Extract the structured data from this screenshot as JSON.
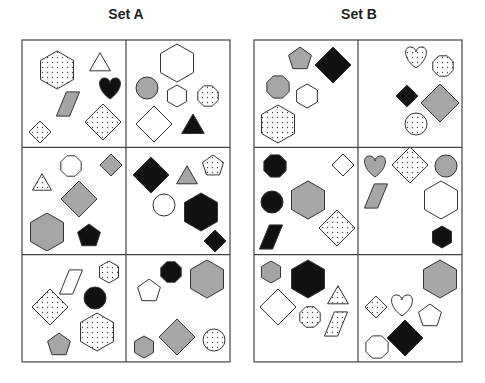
{
  "sets": [
    {
      "title": "Set A",
      "grid": {
        "x": 22,
        "y": 40,
        "col_w": 104,
        "row_h": 107.3
      },
      "panels": [
        {
          "row": 0,
          "col": 0,
          "shapes": [
            {
              "type": "hexagon",
              "fill": "dots",
              "cx": 57,
              "cy": 70,
              "r": 19
            },
            {
              "type": "triangle",
              "fill": "white",
              "cx": 100,
              "cy": 63,
              "r": 12
            },
            {
              "type": "heart",
              "fill": "black",
              "cx": 110,
              "cy": 88,
              "r": 11
            },
            {
              "type": "parallelogram",
              "fill": "gray",
              "cx": 68,
              "cy": 104,
              "r": 11
            },
            {
              "type": "diamond",
              "fill": "dots",
              "cx": 103,
              "cy": 122,
              "r": 18
            },
            {
              "type": "diamond",
              "fill": "dots",
              "cx": 40,
              "cy": 132,
              "r": 11
            }
          ]
        },
        {
          "row": 0,
          "col": 1,
          "shapes": [
            {
              "type": "hexagon",
              "fill": "white",
              "cx": 177,
              "cy": 63,
              "r": 19
            },
            {
              "type": "circle",
              "fill": "gray",
              "cx": 147,
              "cy": 88,
              "r": 11
            },
            {
              "type": "hexagon",
              "fill": "white",
              "cx": 177,
              "cy": 96,
              "r": 11
            },
            {
              "type": "octagon",
              "fill": "dots",
              "cx": 208,
              "cy": 96,
              "r": 11
            },
            {
              "type": "diamond",
              "fill": "white",
              "cx": 154,
              "cy": 124,
              "r": 18
            },
            {
              "type": "triangle",
              "fill": "black",
              "cx": 193,
              "cy": 125,
              "r": 13
            }
          ]
        },
        {
          "row": 1,
          "col": 0,
          "shapes": [
            {
              "type": "octagon",
              "fill": "white",
              "cx": 71,
              "cy": 166,
              "r": 11
            },
            {
              "type": "diamond",
              "fill": "gray",
              "cx": 111,
              "cy": 165,
              "r": 11
            },
            {
              "type": "triangle",
              "fill": "dots",
              "cx": 42,
              "cy": 183,
              "r": 11
            },
            {
              "type": "diamond",
              "fill": "gray",
              "cx": 79,
              "cy": 199,
              "r": 18
            },
            {
              "type": "hexagon",
              "fill": "gray",
              "cx": 47,
              "cy": 232,
              "r": 19
            },
            {
              "type": "pentagon",
              "fill": "black",
              "cx": 89,
              "cy": 236,
              "r": 12
            }
          ]
        },
        {
          "row": 1,
          "col": 1,
          "shapes": [
            {
              "type": "diamond",
              "fill": "black",
              "cx": 151,
              "cy": 175,
              "r": 18
            },
            {
              "type": "triangle",
              "fill": "gray",
              "cx": 187,
              "cy": 176,
              "r": 12
            },
            {
              "type": "pentagon",
              "fill": "dots",
              "cx": 213,
              "cy": 166,
              "r": 11
            },
            {
              "type": "circle",
              "fill": "white",
              "cx": 164,
              "cy": 205,
              "r": 11
            },
            {
              "type": "hexagon",
              "fill": "black",
              "cx": 201,
              "cy": 212,
              "r": 19
            },
            {
              "type": "diamond",
              "fill": "black",
              "cx": 215,
              "cy": 241,
              "r": 11
            }
          ]
        },
        {
          "row": 2,
          "col": 0,
          "shapes": [
            {
              "type": "parallelogram",
              "fill": "white",
              "cx": 71,
              "cy": 282,
              "r": 11
            },
            {
              "type": "hexagon",
              "fill": "dots",
              "cx": 109,
              "cy": 272,
              "r": 11
            },
            {
              "type": "circle",
              "fill": "black",
              "cx": 95,
              "cy": 298,
              "r": 11
            },
            {
              "type": "diamond",
              "fill": "dots",
              "cx": 50,
              "cy": 307,
              "r": 18
            },
            {
              "type": "hexagon",
              "fill": "dots",
              "cx": 97,
              "cy": 332,
              "r": 19
            },
            {
              "type": "pentagon",
              "fill": "gray",
              "cx": 59,
              "cy": 345,
              "r": 12
            }
          ]
        },
        {
          "row": 2,
          "col": 1,
          "shapes": [
            {
              "type": "octagon",
              "fill": "black",
              "cx": 171,
              "cy": 272,
              "r": 11
            },
            {
              "type": "hexagon",
              "fill": "gray",
              "cx": 207,
              "cy": 279,
              "r": 19
            },
            {
              "type": "pentagon",
              "fill": "white",
              "cx": 149,
              "cy": 291,
              "r": 12
            },
            {
              "type": "hexagon",
              "fill": "gray",
              "cx": 144,
              "cy": 347,
              "r": 11
            },
            {
              "type": "diamond",
              "fill": "gray",
              "cx": 177,
              "cy": 337,
              "r": 18
            },
            {
              "type": "circle",
              "fill": "dots",
              "cx": 214,
              "cy": 340,
              "r": 11
            }
          ]
        }
      ]
    },
    {
      "title": "Set B",
      "grid": {
        "x": 254,
        "y": 40,
        "col_w": 104,
        "row_h": 107.3
      },
      "panels": [
        {
          "row": 0,
          "col": 0,
          "shapes": [
            {
              "type": "pentagon",
              "fill": "gray",
              "cx": 300,
              "cy": 59,
              "r": 12
            },
            {
              "type": "diamond",
              "fill": "black",
              "cx": 333,
              "cy": 65,
              "r": 18
            },
            {
              "type": "octagon",
              "fill": "gray",
              "cx": 278,
              "cy": 87,
              "r": 12
            },
            {
              "type": "hexagon",
              "fill": "white",
              "cx": 307,
              "cy": 96,
              "r": 12
            },
            {
              "type": "hexagon",
              "fill": "dots",
              "cx": 278,
              "cy": 124,
              "r": 19
            }
          ]
        },
        {
          "row": 0,
          "col": 1,
          "shapes": [
            {
              "type": "heart",
              "fill": "dots",
              "cx": 416,
              "cy": 57,
              "r": 11
            },
            {
              "type": "octagon",
              "fill": "dots",
              "cx": 443,
              "cy": 66,
              "r": 11
            },
            {
              "type": "diamond",
              "fill": "black",
              "cx": 407,
              "cy": 96,
              "r": 11
            },
            {
              "type": "diamond",
              "fill": "gray",
              "cx": 440,
              "cy": 103,
              "r": 19
            },
            {
              "type": "circle",
              "fill": "dots",
              "cx": 416,
              "cy": 124,
              "r": 11
            }
          ]
        },
        {
          "row": 1,
          "col": 0,
          "shapes": [
            {
              "type": "octagon",
              "fill": "black",
              "cx": 275,
              "cy": 166,
              "r": 12
            },
            {
              "type": "diamond",
              "fill": "white",
              "cx": 343,
              "cy": 165,
              "r": 11
            },
            {
              "type": "circle",
              "fill": "black",
              "cx": 272,
              "cy": 202,
              "r": 11
            },
            {
              "type": "hexagon",
              "fill": "gray",
              "cx": 308,
              "cy": 200,
              "r": 19
            },
            {
              "type": "diamond",
              "fill": "dots",
              "cx": 337,
              "cy": 228,
              "r": 18
            },
            {
              "type": "parallelogram",
              "fill": "black",
              "cx": 271,
              "cy": 237,
              "r": 11
            }
          ]
        },
        {
          "row": 1,
          "col": 1,
          "shapes": [
            {
              "type": "heart",
              "fill": "gray",
              "cx": 375,
              "cy": 166,
              "r": 11
            },
            {
              "type": "diamond",
              "fill": "dots",
              "cx": 410,
              "cy": 165,
              "r": 18
            },
            {
              "type": "circle",
              "fill": "gray",
              "cx": 446,
              "cy": 166,
              "r": 11
            },
            {
              "type": "parallelogram",
              "fill": "gray",
              "cx": 376,
              "cy": 196,
              "r": 11
            },
            {
              "type": "hexagon",
              "fill": "white",
              "cx": 441,
              "cy": 200,
              "r": 19
            },
            {
              "type": "hexagon",
              "fill": "black",
              "cx": 442,
              "cy": 237,
              "r": 11
            }
          ]
        },
        {
          "row": 2,
          "col": 0,
          "shapes": [
            {
              "type": "hexagon",
              "fill": "gray",
              "cx": 271,
              "cy": 272,
              "r": 11
            },
            {
              "type": "hexagon",
              "fill": "black",
              "cx": 308,
              "cy": 279,
              "r": 19
            },
            {
              "type": "triangle",
              "fill": "dots",
              "cx": 338,
              "cy": 296,
              "r": 12
            },
            {
              "type": "diamond",
              "fill": "white",
              "cx": 278,
              "cy": 307,
              "r": 18
            },
            {
              "type": "octagon",
              "fill": "dots",
              "cx": 310,
              "cy": 317,
              "r": 11
            },
            {
              "type": "parallelogram",
              "fill": "dots",
              "cx": 336,
              "cy": 324,
              "r": 11
            }
          ]
        },
        {
          "row": 2,
          "col": 1,
          "shapes": [
            {
              "type": "hexagon",
              "fill": "gray",
              "cx": 440,
              "cy": 279,
              "r": 19
            },
            {
              "type": "diamond",
              "fill": "dots",
              "cx": 376,
              "cy": 307,
              "r": 11
            },
            {
              "type": "heart",
              "fill": "white",
              "cx": 402,
              "cy": 305,
              "r": 11
            },
            {
              "type": "pentagon",
              "fill": "white",
              "cx": 430,
              "cy": 316,
              "r": 12
            },
            {
              "type": "diamond",
              "fill": "black",
              "cx": 405,
              "cy": 338,
              "r": 18
            },
            {
              "type": "octagon",
              "fill": "white",
              "cx": 377,
              "cy": 347,
              "r": 12
            }
          ]
        }
      ]
    }
  ],
  "colors": {
    "black": "#111111",
    "gray": "#a6a6a6",
    "white": "#ffffff",
    "stroke": "#333333",
    "grid": "#444444"
  }
}
